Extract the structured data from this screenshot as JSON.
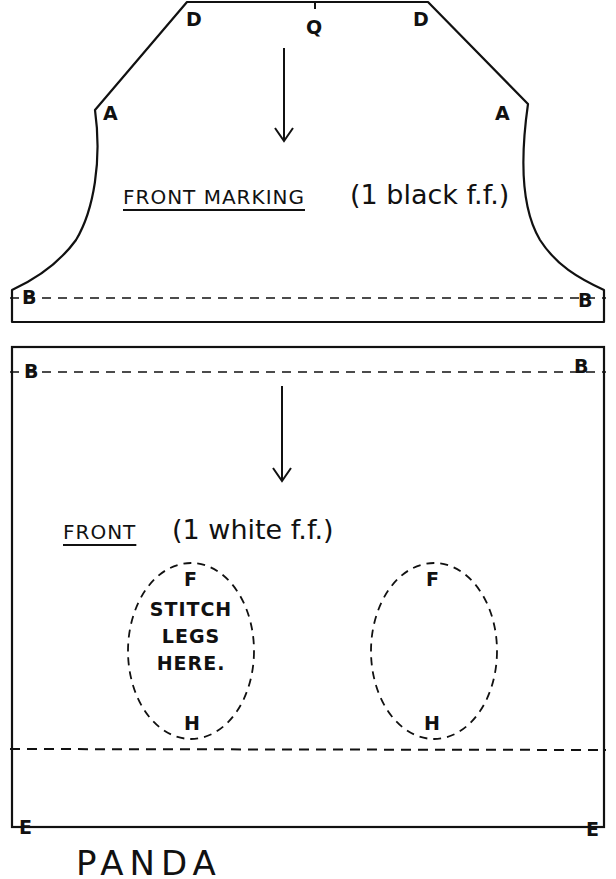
{
  "document": {
    "type": "sewing pattern",
    "ink_color": "#111111",
    "paper_color": "#ffffff"
  },
  "top_piece": {
    "title": "FRONT MARKING",
    "note": "(1 black f.f.)",
    "markers": {
      "d_left": "D",
      "q": "Q",
      "d_right": "D",
      "a_left": "A",
      "a_right": "A",
      "b_left": "B",
      "b_right": "B"
    },
    "arrow": "down-arrow"
  },
  "bottom_piece": {
    "title": "FRONT",
    "note": "(1 white f.f.)",
    "markers": {
      "b_left": "B",
      "b_right": "B",
      "e_left": "E",
      "e_right": "E"
    },
    "arrow": "down-arrow",
    "leg_ovals": [
      {
        "top_marker": "F",
        "bottom_marker": "H",
        "instruction": [
          "STITCH",
          "LEGS",
          "HERE."
        ]
      },
      {
        "top_marker": "F",
        "bottom_marker": "H",
        "instruction": []
      }
    ]
  },
  "footer": {
    "partial_text": "PANDA"
  }
}
